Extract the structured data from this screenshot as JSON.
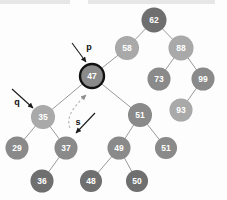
{
  "figure": {
    "type": "binary-search-tree-diagram",
    "width": 227,
    "height": 200,
    "background_color": "#fdfdfd"
  },
  "palette": {
    "node_dark": "#6f6f6f",
    "node_medium": "#8a8a8a",
    "node_light": "#a9a9a9",
    "edge_color": "#9a9a9a",
    "highlight_outline": "#111111",
    "label_text": "#ffffff",
    "pointer_text": "#111111",
    "arrow_solid": "#1a1a1a",
    "arrow_dashed": "#b9b9b9"
  },
  "nodes": [
    {
      "id": "n62",
      "value": "62",
      "x": 154,
      "y": 20,
      "r": 12.5,
      "shade": "node_dark",
      "highlighted": false
    },
    {
      "id": "n58",
      "value": "58",
      "x": 127,
      "y": 48,
      "r": 12.0,
      "shade": "node_light",
      "highlighted": false
    },
    {
      "id": "n88",
      "value": "88",
      "x": 181,
      "y": 48,
      "r": 12.5,
      "shade": "node_light",
      "highlighted": false
    },
    {
      "id": "n47",
      "value": "47",
      "x": 92,
      "y": 76,
      "r": 12.0,
      "shade": "node_medium",
      "highlighted": true
    },
    {
      "id": "n73",
      "value": "73",
      "x": 159,
      "y": 79,
      "r": 11.5,
      "shade": "node_medium",
      "highlighted": false
    },
    {
      "id": "n99",
      "value": "99",
      "x": 203,
      "y": 79,
      "r": 11.5,
      "shade": "node_medium",
      "highlighted": false
    },
    {
      "id": "n93",
      "value": "93",
      "x": 181,
      "y": 110,
      "r": 11.5,
      "shade": "node_light",
      "highlighted": false
    },
    {
      "id": "n35",
      "value": "35",
      "x": 43,
      "y": 117,
      "r": 12.0,
      "shade": "node_light",
      "highlighted": false
    },
    {
      "id": "n51",
      "value": "51",
      "x": 140,
      "y": 115,
      "r": 12.0,
      "shade": "node_medium",
      "highlighted": false
    },
    {
      "id": "n29",
      "value": "29",
      "x": 17,
      "y": 148,
      "r": 11.5,
      "shade": "node_medium",
      "highlighted": false
    },
    {
      "id": "n37",
      "value": "37",
      "x": 66,
      "y": 148,
      "r": 11.5,
      "shade": "node_medium",
      "highlighted": false
    },
    {
      "id": "n49",
      "value": "49",
      "x": 119,
      "y": 148,
      "r": 11.5,
      "shade": "node_medium",
      "highlighted": false
    },
    {
      "id": "n51b",
      "value": "51",
      "x": 166,
      "y": 148,
      "r": 11.0,
      "shade": "node_medium",
      "highlighted": false
    },
    {
      "id": "n36",
      "value": "36",
      "x": 42,
      "y": 181,
      "r": 11.5,
      "shade": "node_dark",
      "highlighted": false
    },
    {
      "id": "n48",
      "value": "48",
      "x": 91,
      "y": 181,
      "r": 11.0,
      "shade": "node_dark",
      "highlighted": false
    },
    {
      "id": "n50",
      "value": "50",
      "x": 137,
      "y": 181,
      "r": 11.0,
      "shade": "node_dark",
      "highlighted": false
    }
  ],
  "edges": [
    {
      "from": "n62",
      "to": "n58"
    },
    {
      "from": "n62",
      "to": "n88"
    },
    {
      "from": "n58",
      "to": "n47"
    },
    {
      "from": "n88",
      "to": "n73"
    },
    {
      "from": "n88",
      "to": "n99"
    },
    {
      "from": "n99",
      "to": "n93"
    },
    {
      "from": "n47",
      "to": "n35"
    },
    {
      "from": "n47",
      "to": "n51"
    },
    {
      "from": "n35",
      "to": "n29"
    },
    {
      "from": "n35",
      "to": "n37"
    },
    {
      "from": "n37",
      "to": "n36"
    },
    {
      "from": "n51",
      "to": "n49"
    },
    {
      "from": "n51",
      "to": "n51b"
    },
    {
      "from": "n49",
      "to": "n48"
    },
    {
      "from": "n49",
      "to": "n50"
    }
  ],
  "pointers": [
    {
      "id": "ptr-p",
      "label": "p",
      "label_x": 89,
      "label_y": 47,
      "arrow": {
        "x1": 72,
        "y1": 43,
        "x2": 86,
        "y2": 62
      },
      "style": "solid",
      "target": "n47"
    },
    {
      "id": "ptr-q",
      "label": "q",
      "label_x": 17,
      "label_y": 102,
      "arrow": {
        "x1": 12,
        "y1": 89,
        "x2": 33,
        "y2": 108
      },
      "style": "solid",
      "target": "n35"
    },
    {
      "id": "ptr-s",
      "label": "s",
      "label_x": 78,
      "label_y": 122,
      "arrow": {
        "x1": 95,
        "y1": 113,
        "x2": 76,
        "y2": 133
      },
      "style": "solid",
      "target": "n37-region"
    },
    {
      "id": "ptr-s-dashed",
      "label": "",
      "style": "dashed-curve",
      "path": "M 70 128 C 66 118, 72 108, 86 95",
      "target": "n47"
    }
  ]
}
